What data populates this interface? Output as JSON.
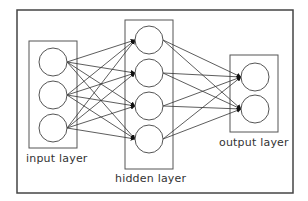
{
  "diagram": {
    "type": "neural-network",
    "colors": {
      "stroke": "#555555",
      "frame": "#444444",
      "text": "#333333",
      "background": "#ffffff"
    },
    "frame": {
      "x": 17,
      "y": 10,
      "w": 276,
      "h": 183
    },
    "layers": [
      {
        "id": "input",
        "label": "input layer",
        "box": {
          "x": 29,
          "y": 41,
          "w": 48,
          "h": 107
        },
        "nodes": [
          {
            "cx": 53,
            "cy": 62
          },
          {
            "cx": 53,
            "cy": 95
          },
          {
            "cx": 53,
            "cy": 128
          }
        ],
        "label_pos": {
          "x": 26,
          "y": 152
        }
      },
      {
        "id": "hidden",
        "label": "hidden layer",
        "box": {
          "x": 125,
          "y": 20,
          "w": 48,
          "h": 149
        },
        "nodes": [
          {
            "cx": 149,
            "cy": 40
          },
          {
            "cx": 149,
            "cy": 73
          },
          {
            "cx": 149,
            "cy": 106
          },
          {
            "cx": 149,
            "cy": 139
          }
        ],
        "label_pos": {
          "x": 115,
          "y": 172
        }
      },
      {
        "id": "output",
        "label": "output layer",
        "box": {
          "x": 230,
          "y": 55,
          "w": 48,
          "h": 77
        },
        "nodes": [
          {
            "cx": 255,
            "cy": 77
          },
          {
            "cx": 255,
            "cy": 109
          }
        ],
        "label_pos": {
          "x": 219,
          "y": 136
        }
      }
    ],
    "node_radius": 14,
    "connections": "fully-connected between adjacent layers with arrowheads at target nodes"
  }
}
